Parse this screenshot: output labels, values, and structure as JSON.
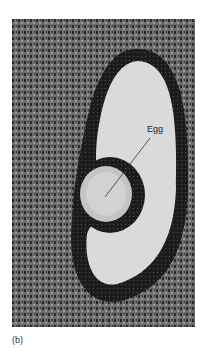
{
  "figure": {
    "panel_label": "(b)",
    "annotation": "Egg",
    "colors": {
      "stroma": "#5a5a5a",
      "granulosa": "#1e1e1e",
      "antrum": "#d9d9d9",
      "egg": "#c8c8c8"
    }
  }
}
